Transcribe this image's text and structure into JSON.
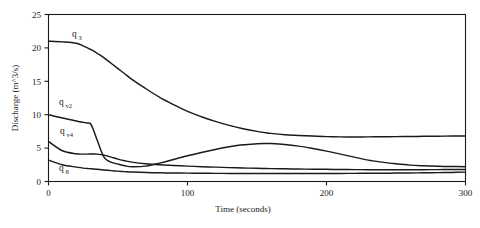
{
  "chart_data": {
    "type": "line",
    "title": "",
    "xlabel": "Time (seconds)",
    "ylabel": "Discharge (m^3/s)",
    "xlim": [
      0,
      300
    ],
    "ylim": [
      0,
      25
    ],
    "xticks": [
      "0",
      "100",
      "200",
      "300"
    ],
    "xtick_values": [
      0,
      100,
      200,
      300
    ],
    "yticks": [
      "0",
      "5",
      "10",
      "15",
      "20",
      "25"
    ],
    "ytick_values": [
      0,
      5,
      10,
      15,
      20,
      25
    ],
    "grid": false,
    "legend_position": "inline-labels",
    "x": [
      0,
      10,
      20,
      25,
      28,
      30,
      32,
      35,
      40,
      45,
      50,
      55,
      60,
      70,
      80,
      90,
      100,
      110,
      120,
      130,
      140,
      150,
      155,
      160,
      170,
      180,
      190,
      200,
      210,
      220,
      230,
      240,
      250,
      260,
      270,
      280,
      290,
      300
    ],
    "series": [
      {
        "name": "q3",
        "label_base": "q",
        "label_sub": "3",
        "values": [
          21.0,
          20.9,
          20.7,
          20.3,
          20.0,
          19.8,
          19.6,
          19.2,
          18.5,
          17.7,
          16.9,
          16.1,
          15.3,
          13.9,
          12.6,
          11.5,
          10.5,
          9.7,
          9.0,
          8.4,
          7.9,
          7.5,
          7.35,
          7.2,
          7.0,
          6.9,
          6.8,
          6.72,
          6.68,
          6.67,
          6.68,
          6.7,
          6.72,
          6.74,
          6.76,
          6.78,
          6.8,
          6.82
        ]
      },
      {
        "name": "qv2",
        "label_base": "q",
        "label_sub": "v2",
        "values": [
          10.0,
          9.5,
          9.05,
          8.85,
          8.75,
          8.7,
          7.9,
          6.2,
          3.6,
          2.9,
          2.6,
          2.35,
          2.2,
          2.3,
          2.75,
          3.3,
          3.85,
          4.35,
          4.8,
          5.2,
          5.5,
          5.65,
          5.7,
          5.68,
          5.55,
          5.3,
          4.95,
          4.55,
          4.1,
          3.65,
          3.2,
          2.9,
          2.65,
          2.45,
          2.35,
          2.28,
          2.24,
          2.22
        ]
      },
      {
        "name": "qv4",
        "label_base": "q",
        "label_sub": "v4",
        "values": [
          6.0,
          4.6,
          4.15,
          4.1,
          4.1,
          4.12,
          4.12,
          4.1,
          3.95,
          3.65,
          3.35,
          3.1,
          2.9,
          2.65,
          2.5,
          2.4,
          2.3,
          2.22,
          2.15,
          2.08,
          2.02,
          1.97,
          1.95,
          1.93,
          1.9,
          1.87,
          1.84,
          1.82,
          1.8,
          1.78,
          1.77,
          1.76,
          1.76,
          1.76,
          1.77,
          1.78,
          1.79,
          1.8
        ]
      },
      {
        "name": "q8",
        "label_base": "q",
        "label_sub": "8",
        "values": [
          3.2,
          2.5,
          2.15,
          2.0,
          1.95,
          1.92,
          1.88,
          1.82,
          1.72,
          1.63,
          1.55,
          1.48,
          1.42,
          1.35,
          1.3,
          1.27,
          1.25,
          1.23,
          1.22,
          1.21,
          1.2,
          1.2,
          1.2,
          1.2,
          1.2,
          1.2,
          1.2,
          1.2,
          1.21,
          1.22,
          1.23,
          1.24,
          1.26,
          1.28,
          1.3,
          1.33,
          1.36,
          1.4
        ]
      }
    ]
  },
  "labels": {
    "q3": {
      "base": "q",
      "sub": "3"
    },
    "qv2": {
      "base": "q",
      "sub": "v2"
    },
    "qv4": {
      "base": "q",
      "sub": "v4"
    },
    "q8": {
      "base": "q",
      "sub": "8"
    }
  },
  "axes": {
    "x_title": "Time (seconds)",
    "y_title": "Discharge (m^3/s)",
    "x_tick_0": "0",
    "x_tick_1": "100",
    "x_tick_2": "200",
    "x_tick_3": "300",
    "y_tick_0": "0",
    "y_tick_1": "5",
    "y_tick_2": "10",
    "y_tick_3": "15",
    "y_tick_4": "20",
    "y_tick_5": "25"
  },
  "colors": {
    "line": "#1a1a1a",
    "background": "#ffffff",
    "text": "#1a1a1a"
  }
}
